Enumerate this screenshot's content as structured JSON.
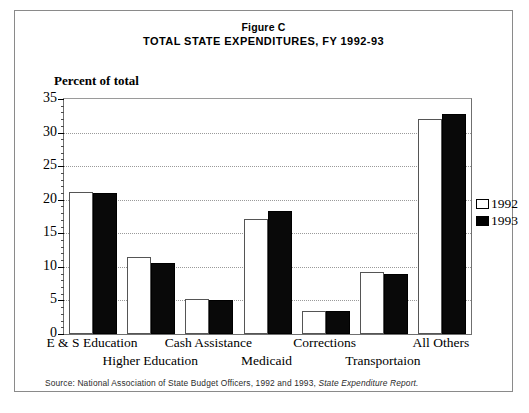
{
  "figure": {
    "label": "Figure C",
    "title": "TOTAL STATE EXPENDITURES, FY 1992-93",
    "axis_caption": "Percent of total",
    "source_note": "Source: National Association of State Budget Officers, 1992 and 1993, State Expenditure Report."
  },
  "legend": {
    "position": "right",
    "entries": [
      {
        "label": "1992",
        "color": "#ffffff"
      },
      {
        "label": "1993",
        "color": "#000000"
      }
    ]
  },
  "chart_data": {
    "type": "bar",
    "title": "TOTAL STATE EXPENDITURES, FY 1992-93",
    "subtitle": "Figure C",
    "xlabel": "",
    "ylabel": "Percent of total",
    "ylim": [
      0,
      35
    ],
    "yticks": [
      0,
      5,
      10,
      15,
      20,
      25,
      30,
      35
    ],
    "ytick_labels": [
      "0",
      "5",
      "10",
      "15",
      "20",
      "25",
      "30",
      "35"
    ],
    "grid": true,
    "grid_axis": "y",
    "minor_ticks": true,
    "categories": [
      "E & S Education",
      "Higher Education",
      "Cash Assistance",
      "Medicaid",
      "Corrections",
      "Transportaion",
      "All Others"
    ],
    "series": [
      {
        "name": "1992",
        "color": "#ffffff",
        "values": [
          21.2,
          11.5,
          5.2,
          17.2,
          3.5,
          9.2,
          32.0
        ]
      },
      {
        "name": "1993",
        "color": "#000000",
        "values": [
          21.0,
          10.6,
          5.1,
          18.3,
          3.4,
          9.0,
          32.7
        ]
      }
    ]
  }
}
